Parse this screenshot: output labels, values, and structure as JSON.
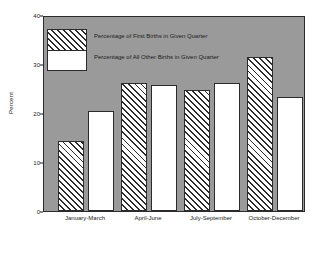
{
  "chart_data": {
    "type": "bar",
    "title": "",
    "xlabel": "",
    "ylabel": "Percent",
    "ylim": [
      0,
      40
    ],
    "yticks": [
      0,
      10,
      20,
      30,
      40
    ],
    "grid": false,
    "legend_position": "upper-left-inside",
    "categories": [
      "January-March",
      "April-June",
      "July-September",
      "October-December"
    ],
    "series": [
      {
        "name": "Percentage of First Births in Given Quarter",
        "style": "hatched",
        "values": [
          14.3,
          26.1,
          24.7,
          31.4
        ]
      },
      {
        "name": "Percentage of All Other Births in Given Quarter",
        "style": "white",
        "values": [
          20.4,
          25.7,
          26.1,
          23.3
        ]
      }
    ],
    "colors": {
      "plot_background": "#9a9a9a",
      "page_background": "#ffffff",
      "axis": "#2b2b2b",
      "bar_fill": "#ffffff",
      "hatch": "#2b2b2b",
      "text": "#1a1a1a"
    }
  }
}
